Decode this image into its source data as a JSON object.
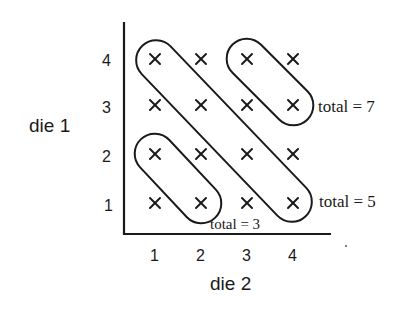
{
  "diagram": {
    "title": "",
    "y_axis": {
      "label": "die 1",
      "ticks": [
        "1",
        "2",
        "3",
        "4"
      ]
    },
    "x_axis": {
      "label": "die 2",
      "ticks": [
        "1",
        "2",
        "3",
        "4"
      ]
    },
    "grid": {
      "rows": 4,
      "cols": 4,
      "marker": "×",
      "outcomes": [
        {
          "die1": 1,
          "die2": 1
        },
        {
          "die1": 1,
          "die2": 2
        },
        {
          "die1": 1,
          "die2": 3
        },
        {
          "die1": 1,
          "die2": 4
        },
        {
          "die1": 2,
          "die2": 1
        },
        {
          "die1": 2,
          "die2": 2
        },
        {
          "die1": 2,
          "die2": 3
        },
        {
          "die1": 2,
          "die2": 4
        },
        {
          "die1": 3,
          "die2": 1
        },
        {
          "die1": 3,
          "die2": 2
        },
        {
          "die1": 3,
          "die2": 3
        },
        {
          "die1": 3,
          "die2": 4
        },
        {
          "die1": 4,
          "die2": 1
        },
        {
          "die1": 4,
          "die2": 2
        },
        {
          "die1": 4,
          "die2": 3
        },
        {
          "die1": 4,
          "die2": 4
        }
      ]
    },
    "groups": [
      {
        "label": "total = 3",
        "cells": [
          [
            2,
            1
          ],
          [
            1,
            2
          ]
        ]
      },
      {
        "label": "total = 5",
        "cells": [
          [
            4,
            1
          ],
          [
            3,
            2
          ],
          [
            2,
            3
          ],
          [
            1,
            4
          ]
        ]
      },
      {
        "label": "total = 7",
        "cells": [
          [
            4,
            3
          ],
          [
            3,
            4
          ]
        ]
      }
    ]
  }
}
